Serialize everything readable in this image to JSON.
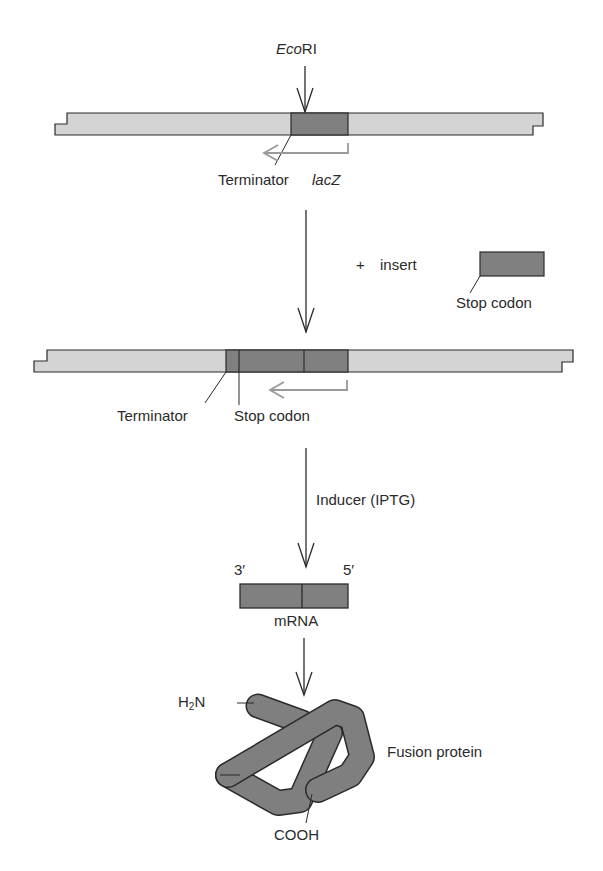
{
  "diagram": {
    "colors": {
      "vector_fill": "#d4d4d4",
      "insert_fill": "#808080",
      "outline": "#2a2a2a",
      "promoter_arrow": "#9a9a9a",
      "protein_fill": "#7f7f7f"
    },
    "step1": {
      "enzyme_italic": "Eco",
      "enzyme_roman": "RI",
      "terminator_label": "Terminator",
      "gene_label": "lacZ"
    },
    "step2": {
      "plus_sign": "+",
      "insert_label": "insert",
      "insert_part_label": "Stop codon"
    },
    "step3": {
      "terminator_label": "Terminator",
      "stop_codon_label": "Stop codon"
    },
    "step4": {
      "inducer_label": "Inducer (IPTG)",
      "three_prime": "3′",
      "five_prime": "5′",
      "mrna_label": "mRNA"
    },
    "step5": {
      "n_terminus_main": "H",
      "n_terminus_sub": "2",
      "n_terminus_end": "N",
      "c_terminus": "COOH",
      "product_label": "Fusion protein"
    }
  }
}
